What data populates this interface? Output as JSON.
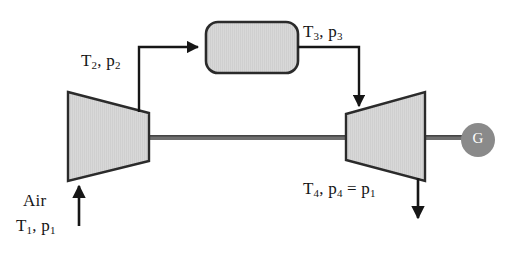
{
  "diagram": {
    "components": {
      "compressor": {
        "name": "compressor",
        "shape": "trapezoid-narrowing-right"
      },
      "combustor": {
        "name": "combustion-chamber",
        "shape": "rounded-rectangle"
      },
      "turbine": {
        "name": "turbine",
        "shape": "trapezoid-widening-right"
      },
      "generator": {
        "name": "generator",
        "label": "G",
        "shape": "circle"
      },
      "shaft": {
        "name": "shaft",
        "shape": "horizontal-bar"
      }
    },
    "labels": {
      "state2": {
        "t": "T",
        "t_sub": "2",
        "sep": ", ",
        "p": "p",
        "p_sub": "2"
      },
      "state3": {
        "t": "T",
        "t_sub": "3",
        "sep": ", ",
        "p": "p",
        "p_sub": "3"
      },
      "state4": {
        "t": "T",
        "t_sub": "4",
        "sep": ", ",
        "p": "p",
        "p_sub": "4",
        "eq": " = ",
        "p2": "p",
        "p2_sub": "1"
      },
      "air": "Air",
      "state1": {
        "t": "T",
        "t_sub": "1",
        "sep": ", ",
        "p": "p",
        "p_sub": "1"
      },
      "generator": "G"
    },
    "flows": [
      {
        "name": "air-inlet-arrow",
        "from": "ambient air",
        "to": "compressor",
        "direction": "up"
      },
      {
        "name": "compressor-to-combustor-pipe",
        "from": "compressor",
        "to": "combustion-chamber",
        "direction": "right"
      },
      {
        "name": "combustor-to-turbine-pipe",
        "from": "combustion-chamber",
        "to": "turbine",
        "direction": "down"
      },
      {
        "name": "exhaust-arrow",
        "from": "turbine",
        "to": "ambient",
        "direction": "down"
      }
    ],
    "colors": {
      "component_fill": "#d6d6d6",
      "component_stroke": "#2b2b2b",
      "generator_fill": "#8a8a8a",
      "generator_text": "#ffffff",
      "line": "#161616",
      "shaft": "#6f6f6f",
      "background": "#ffffff"
    }
  }
}
